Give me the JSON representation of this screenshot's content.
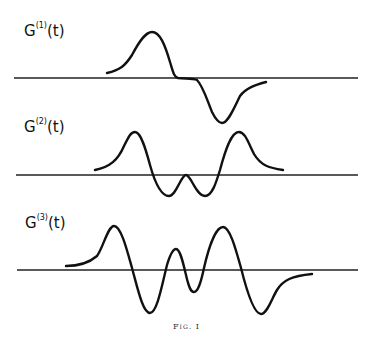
{
  "figure": {
    "caption": "Fig. I",
    "panels": [
      {
        "label_base": "G",
        "label_sup": "(1)",
        "label_arg": "(t)",
        "axis": {
          "x1": 14,
          "x2": 358,
          "y": 78
        },
        "curve": "M107,73 C120,70 125,66 132,55 C140,40 146,32 152,32 C160,32 165,45 170,62 C173,72 174,77 178,78 C185,79 192,78 197,80 C203,86 207,100 212,112 C216,120 219,123 222,123 C228,123 234,108 240,96 C246,88 255,85 266,82"
      },
      {
        "label_base": "G",
        "label_sup": "(2)",
        "label_arg": "(t)",
        "axis": {
          "x1": 16,
          "x2": 358,
          "y": 175
        },
        "curve": "M95,170 C110,167 118,160 124,146 C129,136 131,132 135,132 C141,132 146,150 150,165 C155,183 161,196 169,196 C176,196 181,175 186,175 C191,175 196,196 205,196 C212,196 216,183 220,170 C225,151 231,132 239,132 C245,132 248,142 254,154 C261,166 270,168 283,170"
      },
      {
        "label_base": "G",
        "label_sup": "(3)",
        "label_arg": "(t)",
        "axis": {
          "x1": 17,
          "x2": 358,
          "y": 270
        },
        "curve": "M66,266 C80,266 90,262 97,256 C103,248 108,226 114,226 C121,226 127,250 132,268 C138,290 143,313 150,313 C157,313 162,285 167,265 C170,255 173,249 176,249 C180,249 183,262 186,275 C189,288 191,292 194,292 C198,292 201,282 204,268 C209,246 216,227 223,227 C230,227 236,250 241,268 C247,292 254,314 261,314 C267,314 272,298 277,290 C283,280 292,276 312,274"
      }
    ]
  }
}
